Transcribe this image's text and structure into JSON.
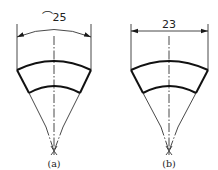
{
  "figures": [
    {
      "id": "a",
      "caption": "(a)",
      "dimension_type": "arc-length",
      "dimension_label": "⌒25",
      "dimension_value": "25"
    },
    {
      "id": "b",
      "caption": "(b)",
      "dimension_type": "chord-length",
      "dimension_label": "23",
      "dimension_value": "23"
    }
  ],
  "colors": {
    "line": "#1a1a1a",
    "background": "#ffffff"
  }
}
